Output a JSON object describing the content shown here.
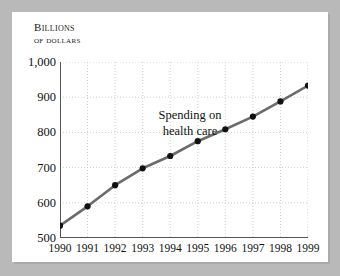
{
  "figure": {
    "axis_title_line1": "Billions",
    "axis_title_line2": "of dollars",
    "annotation_line1": "Spending on",
    "annotation_line2": "health care",
    "line_color": "#6b6b6b",
    "marker_color": "#111111",
    "grid_color": "#cfcfcf",
    "axis_color": "#555555",
    "frame_color": "#b9b9b9",
    "card_color": "#ffffff"
  },
  "chart_data": {
    "type": "line",
    "title": "Billions of dollars",
    "xlabel": "",
    "ylabel": "Billions of dollars",
    "annotation": "Spending on health care",
    "grid": true,
    "legend_position": "none",
    "categories": [
      "1990",
      "1991",
      "1992",
      "1993",
      "1994",
      "1995",
      "1996",
      "1997",
      "1998",
      "1999"
    ],
    "x_tick_labels": [
      "1990",
      "1991",
      "1992",
      "1993",
      "1994",
      "1995",
      "1996",
      "1997",
      "1998",
      "1999"
    ],
    "y_tick_labels": [
      "1,000",
      "900",
      "800",
      "700",
      "600",
      "500"
    ],
    "y_tick_values": [
      1000,
      900,
      800,
      700,
      600,
      500
    ],
    "ylim": [
      500,
      1000
    ],
    "series": [
      {
        "name": "Spending on health care",
        "values": [
          535,
          590,
          650,
          698,
          733,
          775,
          809,
          845,
          888,
          933
        ]
      }
    ]
  }
}
